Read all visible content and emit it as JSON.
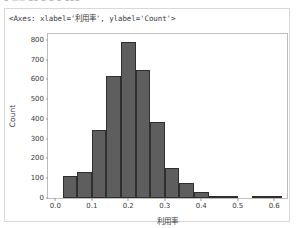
{
  "top_cut_ghost_text": "▪ ▬▬ ▪▪  ▪    ▪      ▪    ▪▪▪",
  "repr_text": "<Axes: xlabel='利用率', ylabel='Count'>",
  "chart_data": {
    "type": "bar",
    "chart_kind": "histogram",
    "title": "",
    "xlabel": "利用率",
    "ylabel": "Count",
    "xlim": [
      -0.02,
      0.635
    ],
    "ylim": [
      0,
      830
    ],
    "grid": false,
    "legend": false,
    "bar_color": "#5e5e5e",
    "bar_edge_color": "#2f2f2f",
    "axes_color": "#bdbdbd",
    "bin_width": 0.04,
    "xticks": [
      0.0,
      0.1,
      0.2,
      0.3,
      0.4,
      0.5,
      0.6
    ],
    "xtick_labels": [
      "0.0",
      "0.1",
      "0.2",
      "0.3",
      "0.4",
      "0.5",
      "0.6"
    ],
    "yticks": [
      0,
      100,
      200,
      300,
      400,
      500,
      600,
      700,
      800
    ],
    "ytick_labels": [
      "0",
      "100",
      "200",
      "300",
      "400",
      "500",
      "600",
      "700",
      "800"
    ],
    "bins": [
      {
        "x0": 0.02,
        "x1": 0.06,
        "value": 110
      },
      {
        "x0": 0.06,
        "x1": 0.1,
        "value": 130
      },
      {
        "x0": 0.1,
        "x1": 0.14,
        "value": 345
      },
      {
        "x0": 0.14,
        "x1": 0.18,
        "value": 620
      },
      {
        "x0": 0.18,
        "x1": 0.22,
        "value": 790
      },
      {
        "x0": 0.22,
        "x1": 0.26,
        "value": 650
      },
      {
        "x0": 0.26,
        "x1": 0.3,
        "value": 385
      },
      {
        "x0": 0.3,
        "x1": 0.34,
        "value": 150
      },
      {
        "x0": 0.34,
        "x1": 0.38,
        "value": 75
      },
      {
        "x0": 0.38,
        "x1": 0.42,
        "value": 30
      },
      {
        "x0": 0.42,
        "x1": 0.46,
        "value": 12
      },
      {
        "x0": 0.46,
        "x1": 0.5,
        "value": 10
      },
      {
        "x0": 0.54,
        "x1": 0.58,
        "value": 6
      },
      {
        "x0": 0.58,
        "x1": 0.62,
        "value": 6
      }
    ]
  }
}
